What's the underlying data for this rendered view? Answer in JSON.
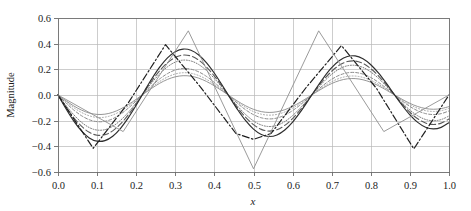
{
  "chart_data": {
    "type": "line",
    "title": "",
    "xlabel": "x",
    "ylabel": "Magnitude",
    "xlim": [
      0.0,
      1.0
    ],
    "ylim": [
      -0.6,
      0.6
    ],
    "grid": true,
    "legend": "none",
    "xticks": [
      "0.0",
      "0.1",
      "0.2",
      "0.3",
      "0.4",
      "0.5",
      "0.6",
      "0.7",
      "0.8",
      "0.9",
      "1.0"
    ],
    "xtick_values": [
      0.0,
      0.1,
      0.2,
      0.3,
      0.4,
      0.5,
      0.6,
      0.7,
      0.8,
      0.9,
      1.0
    ],
    "yticks": [
      "0.6",
      "0.4",
      "0.2",
      "0.0",
      "−0.2",
      "−0.4",
      "−0.6"
    ],
    "ytick_values": [
      0.6,
      0.4,
      0.2,
      0.0,
      -0.2,
      -0.4,
      -0.6
    ],
    "x": [
      0.0,
      0.02,
      0.04,
      0.06,
      0.08,
      0.1,
      0.12,
      0.14,
      0.16,
      0.18,
      0.2,
      0.22,
      0.24,
      0.26,
      0.28,
      0.3,
      0.32,
      0.34,
      0.36,
      0.38,
      0.4,
      0.42,
      0.44,
      0.46,
      0.48,
      0.5,
      0.52,
      0.54,
      0.56,
      0.58,
      0.6,
      0.62,
      0.64,
      0.66,
      0.68,
      0.7,
      0.72,
      0.74,
      0.76,
      0.78,
      0.8,
      0.82,
      0.84,
      0.86,
      0.88,
      0.9,
      0.92,
      0.94,
      0.96,
      0.98,
      1.0
    ],
    "series": [
      {
        "name": "mode-1",
        "style": "solid",
        "color": "#8a8a8a",
        "width": 0.9,
        "amplitude": 0.145,
        "values": [
          0.0,
          -0.0443,
          -0.0846,
          -0.1175,
          -0.1404,
          -0.1513,
          -0.1494,
          -0.1349,
          -0.1091,
          -0.0742,
          -0.0332,
          0.0105,
          0.0531,
          0.0912,
          0.1215,
          0.1418,
          0.1504,
          0.1467,
          0.1312,
          0.1052,
          0.0711,
          0.0318,
          -0.0094,
          -0.0492,
          -0.0843,
          -0.1117,
          -0.1294,
          -0.1359,
          -0.1307,
          -0.1145,
          -0.0886,
          -0.0553,
          -0.0176,
          0.0212,
          0.058,
          0.0894,
          0.1127,
          0.1259,
          0.1279,
          0.1187,
          0.0992,
          0.0714,
          0.0378,
          0.0017,
          -0.0336,
          -0.065,
          -0.0897,
          -0.1055,
          -0.111,
          -0.1058,
          -0.0905
        ]
      },
      {
        "name": "mode-2",
        "style": "dotted",
        "color": "#9e9e9e",
        "width": 0.9,
        "amplitude": 0.172,
        "values": [
          0.0,
          -0.0512,
          -0.0977,
          -0.1357,
          -0.1621,
          -0.1748,
          -0.1726,
          -0.1559,
          -0.126,
          -0.0857,
          -0.0384,
          0.0121,
          0.0613,
          0.1053,
          0.1403,
          0.1638,
          0.1737,
          0.1694,
          0.1516,
          0.1215,
          0.0821,
          0.0367,
          -0.0109,
          -0.0568,
          -0.0974,
          -0.129,
          -0.1495,
          -0.157,
          -0.151,
          -0.1322,
          -0.1023,
          -0.0639,
          -0.0203,
          0.0245,
          0.067,
          0.1033,
          0.1302,
          0.1454,
          0.1477,
          0.1371,
          0.1146,
          0.0825,
          0.0437,
          0.002,
          -0.0388,
          -0.0751,
          -0.1036,
          -0.1218,
          -0.1282,
          -0.1222,
          -0.1045
        ]
      },
      {
        "name": "mode-3",
        "style": "dashed-fine",
        "color": "#8c8c8c",
        "width": 1.0,
        "amplitude": 0.199,
        "values": [
          0.0,
          -0.0608,
          -0.1161,
          -0.1612,
          -0.1927,
          -0.2076,
          -0.205,
          -0.1852,
          -0.1497,
          -0.1018,
          -0.0456,
          0.0144,
          0.0729,
          0.1251,
          0.1667,
          0.1946,
          0.2064,
          0.2013,
          0.1801,
          0.1444,
          0.0976,
          0.0436,
          -0.0129,
          -0.0675,
          -0.1157,
          -0.1533,
          -0.1776,
          -0.1865,
          -0.1794,
          -0.1571,
          -0.1216,
          -0.0759,
          -0.0241,
          0.0291,
          0.0796,
          0.1227,
          0.1547,
          0.1728,
          0.1755,
          0.1629,
          0.1362,
          0.098,
          0.0519,
          0.0024,
          -0.0461,
          -0.0892,
          -0.1231,
          -0.1448,
          -0.1523,
          -0.1452,
          -0.1242
        ]
      },
      {
        "name": "mode-4",
        "style": "dotted-dense",
        "color": "#7a7a7a",
        "width": 1.0,
        "amplitude": 0.262,
        "values": [
          0.0,
          -0.0801,
          -0.1529,
          -0.2123,
          -0.2538,
          -0.2734,
          -0.27,
          -0.2439,
          -0.1971,
          -0.1341,
          -0.0601,
          0.019,
          0.096,
          0.1648,
          0.2196,
          0.2563,
          0.2718,
          0.2651,
          0.2372,
          0.1902,
          0.1285,
          0.0574,
          -0.017,
          -0.0889,
          -0.1524,
          -0.2019,
          -0.2339,
          -0.2456,
          -0.2363,
          -0.2069,
          -0.1602,
          -0.1,
          -0.0318,
          0.0383,
          0.1049,
          0.1616,
          0.2038,
          0.2276,
          0.2311,
          0.2145,
          0.1794,
          0.1291,
          0.0683,
          0.0032,
          -0.0607,
          -0.1175,
          -0.1621,
          -0.1906,
          -0.2006,
          -0.1913,
          -0.1636
        ]
      },
      {
        "name": "mode-5",
        "style": "dashed-long",
        "color": "#5a5a5a",
        "width": 1.1,
        "amplitude": 0.3,
        "values": [
          0.0,
          -0.0917,
          -0.1751,
          -0.2432,
          -0.2907,
          -0.3131,
          -0.3092,
          -0.2793,
          -0.2257,
          -0.1536,
          -0.0688,
          0.0218,
          0.1099,
          0.1887,
          0.2515,
          0.2935,
          0.3112,
          0.3036,
          0.2716,
          0.2178,
          0.1472,
          0.0657,
          -0.0195,
          -0.1018,
          -0.1745,
          -0.2312,
          -0.2679,
          -0.2813,
          -0.2706,
          -0.2369,
          -0.1834,
          -0.1145,
          -0.0364,
          0.0439,
          0.1201,
          0.1851,
          0.2334,
          0.2607,
          0.2647,
          0.2457,
          0.2054,
          0.1478,
          0.0782,
          0.0036,
          -0.0695,
          -0.1346,
          -0.1856,
          -0.2183,
          -0.2297,
          -0.2191,
          -0.1873
        ]
      },
      {
        "name": "mode-6",
        "style": "solid-dark",
        "color": "#2e2e2e",
        "width": 1.2,
        "amplitude": 0.345,
        "values": [
          0.0,
          -0.1055,
          -0.2014,
          -0.2796,
          -0.3343,
          -0.36,
          -0.3555,
          -0.3212,
          -0.2595,
          -0.1766,
          -0.0791,
          0.0251,
          0.1264,
          0.217,
          0.2892,
          0.3375,
          0.3579,
          0.3491,
          0.3123,
          0.2505,
          0.1693,
          0.0756,
          -0.0224,
          -0.1171,
          -0.2006,
          -0.2659,
          -0.3081,
          -0.3235,
          -0.3112,
          -0.2724,
          -0.2109,
          -0.1317,
          -0.0419,
          0.0505,
          0.1381,
          0.2129,
          0.2684,
          0.2998,
          0.3044,
          0.2825,
          0.2362,
          0.17,
          0.0899,
          0.0041,
          -0.0799,
          -0.1548,
          -0.2135,
          -0.2511,
          -0.2642,
          -0.252,
          -0.2154
        ]
      },
      {
        "name": "mode-7-dashdot",
        "style": "dash-dot",
        "color": "#1f1f1f",
        "width": 1.2,
        "amplitude": 0.4,
        "piecewise_x": [
          0.0,
          0.09,
          0.18,
          0.275,
          0.365,
          0.455,
          0.5,
          0.545,
          0.635,
          0.725,
          0.815,
          0.91,
          1.0
        ],
        "piecewise_y": [
          0.0,
          -0.415,
          -0.06,
          0.392,
          0.06,
          -0.3,
          -0.345,
          -0.3,
          0.06,
          0.385,
          0.05,
          -0.42,
          0.0
        ]
      },
      {
        "name": "target-triangle-wave",
        "style": "solid-thin",
        "color": "#8f8f8f",
        "width": 0.9,
        "amplitude": 0.5,
        "piecewise_x": [
          0.0,
          0.1667,
          0.3333,
          0.5,
          0.6667,
          0.8333,
          1.0
        ],
        "piecewise_y": [
          0.0,
          -0.285,
          0.5,
          -0.575,
          0.5,
          -0.285,
          0.0
        ]
      }
    ]
  },
  "figure": {
    "background": "#ffffff",
    "frame_color": "#6b6b6b",
    "grid_color": "#b8b8b8"
  }
}
